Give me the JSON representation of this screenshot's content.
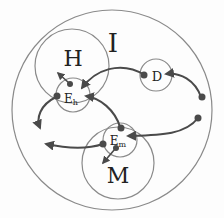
{
  "diagram": {
    "colors": {
      "circle_stroke": "#8a8a8a",
      "arrow": "#4a4a4a",
      "dot": "#4a4a4a",
      "text": "#222222",
      "background": "#fdfdfd"
    },
    "labels": {
      "outer": "I",
      "h_region": "H",
      "d_region": "D",
      "m_region": "M",
      "eh_main": "E",
      "eh_sub": "h",
      "em_main": "E",
      "em_sub": "m"
    },
    "nodes": [
      {
        "id": "I",
        "label": "I",
        "cx": 112,
        "cy": 110,
        "r": 100
      },
      {
        "id": "H",
        "label": "H",
        "cx": 72,
        "cy": 66,
        "r": 37
      },
      {
        "id": "Eh",
        "label": "Eh",
        "cx": 73,
        "cy": 95,
        "r": 17
      },
      {
        "id": "D",
        "label": "D",
        "cx": 156,
        "cy": 75,
        "r": 16
      },
      {
        "id": "M",
        "label": "M",
        "cx": 118,
        "cy": 163,
        "r": 36
      },
      {
        "id": "Em",
        "label": "Em",
        "cx": 120,
        "cy": 140,
        "r": 17
      }
    ],
    "arrows": [
      {
        "from": "external-right-upper",
        "to": "D"
      },
      {
        "from": "D",
        "to": "Eh"
      },
      {
        "from": "Eh",
        "to": "H"
      },
      {
        "from": "Eh",
        "to": "outside-left"
      },
      {
        "from": "Em",
        "to": "Eh"
      },
      {
        "from": "external-right-lower",
        "to": "Em"
      },
      {
        "from": "Em",
        "to": "outside-left-lower"
      },
      {
        "from": "Em",
        "to": "M"
      }
    ]
  }
}
